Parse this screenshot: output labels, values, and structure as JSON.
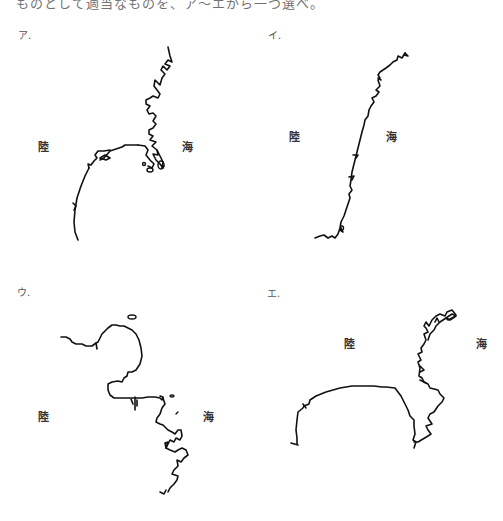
{
  "question": {
    "cut_text": "ものとして適当なものを、ア〜エから一つ選べ。"
  },
  "panels": [
    {
      "id": "a",
      "label": "ア.",
      "land_label": "陸",
      "sea_label": "海"
    },
    {
      "id": "i",
      "label": "イ.",
      "land_label": "陸",
      "sea_label": "海"
    },
    {
      "id": "u",
      "label": "ウ.",
      "land_label": "陸",
      "sea_label": "海"
    },
    {
      "id": "e",
      "label": "エ.",
      "land_label": "陸",
      "sea_label": "海"
    }
  ]
}
